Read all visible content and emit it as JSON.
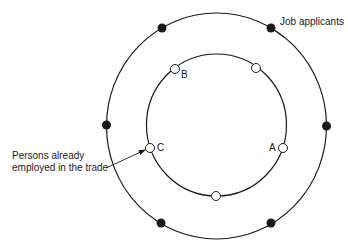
{
  "diagram": {
    "outer_label": "Job applicants",
    "inner_label_line1": "Persons already",
    "inner_label_line2": "employed in the trade",
    "point_labels": {
      "a": "A",
      "b": "B",
      "c": "C"
    },
    "outer_circle": {
      "cx": 216.5,
      "cy": 126,
      "r": 111
    },
    "inner_circle": {
      "cx": 216.5,
      "cy": 125,
      "r": 70
    },
    "outer_filled_points": 6,
    "inner_open_points": 5
  }
}
